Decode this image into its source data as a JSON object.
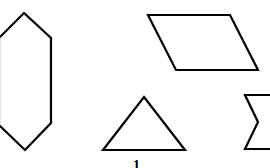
{
  "figure": {
    "type": "geometric-shapes",
    "stroke_color": "#000000",
    "background_color": "#ffffff",
    "shapes": [
      {
        "name": "hexagon",
        "points": "24,13 51,38 51,123 25,150 -1,125 -1,38"
      },
      {
        "name": "parallelogram",
        "points": "148,15 230,15 258,70 176,70"
      },
      {
        "name": "triangle",
        "points": "144,97 185,150 103,150"
      },
      {
        "name": "hourglass-sigma",
        "points": "272,95 245,95 258,122 245,149 272,149"
      }
    ],
    "label": "1"
  }
}
